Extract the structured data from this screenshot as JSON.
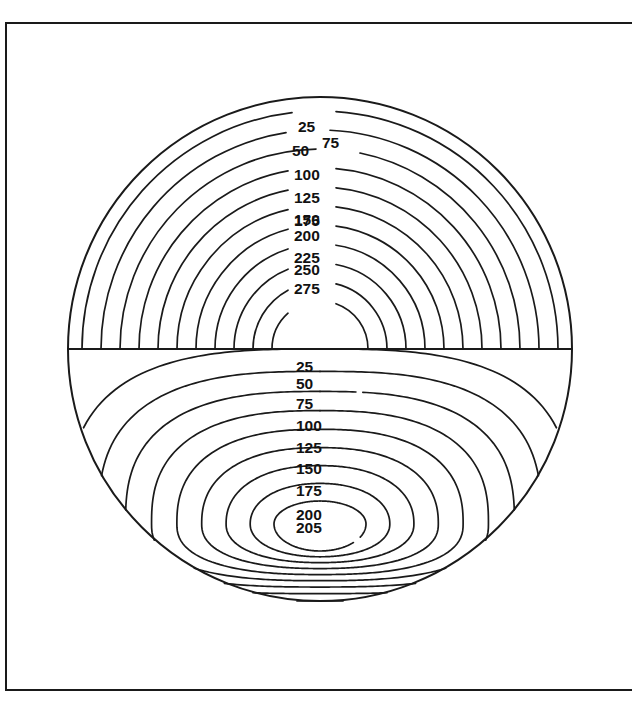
{
  "figure": {
    "caption": "",
    "frame": {
      "stroke_color": "#1a1a1a",
      "left": 5,
      "top": 22,
      "bottom": 689,
      "right_open": true
    },
    "background_color": "#ffffff",
    "line_color": "#1a1a1a"
  },
  "chart_data": {
    "type": "contour",
    "title": "",
    "subtitle": "",
    "xlabel": "",
    "ylabel": "",
    "grid": false,
    "legend": "none",
    "geometry": {
      "circle_center_x": 320,
      "circle_center_y": 349,
      "circle_radius": 252,
      "midline_y": 349
    },
    "panels": [
      {
        "name": "upper-half",
        "contour_style": "concentric-semicircles",
        "origin_x": 320,
        "origin_y": 349,
        "levels": [
          25,
          50,
          75,
          100,
          125,
          150,
          175,
          200,
          225,
          250,
          275
        ],
        "level_radii": [
          238,
          219,
          200,
          181,
          162,
          143,
          124,
          105,
          86,
          67,
          48
        ],
        "labels": [
          "25",
          "50",
          "75",
          "100",
          "125",
          "150",
          "175",
          "200",
          "225",
          "250",
          "275"
        ]
      },
      {
        "name": "lower-half",
        "contour_style": "nested-closed-ovals",
        "center_x": 320,
        "center_y": 524,
        "levels": [
          25,
          50,
          75,
          100,
          125,
          150,
          175,
          200,
          205
        ],
        "labels": [
          "25",
          "50",
          "75",
          "100",
          "125",
          "150",
          "175",
          "200",
          "205"
        ],
        "maximum_value": 205
      }
    ],
    "all_levels": [
      25,
      50,
      75,
      100,
      125,
      150,
      175,
      200,
      225,
      250,
      275,
      205
    ],
    "contour_interval": 25
  },
  "upper_labels": [
    {
      "text": "25",
      "x": 298,
      "y": 128,
      "anchor": "start",
      "gap_half_width": 30
    },
    {
      "text": "50",
      "x": 292,
      "y": 152,
      "anchor": "start",
      "gap_half_width": 30
    },
    {
      "text": "75",
      "x": 322,
      "y": 144,
      "anchor": "start",
      "gap_half_width": 30
    },
    {
      "text": "100",
      "x": 294,
      "y": 176,
      "anchor": "start",
      "gap_half_width": 34
    },
    {
      "text": "125",
      "x": 294,
      "y": 199,
      "anchor": "start",
      "gap_half_width": 34
    },
    {
      "text": "150",
      "x": 294,
      "y": 221,
      "anchor": "start",
      "gap_half_width": 34
    },
    {
      "text": "175",
      "x": 294,
      "y": 222,
      "anchor": "start",
      "gap_half_width": 34
    },
    {
      "text": "200",
      "x": 294,
      "y": 237,
      "anchor": "start",
      "gap_half_width": 34
    },
    {
      "text": "225",
      "x": 294,
      "y": 259,
      "anchor": "start",
      "gap_half_width": 34
    },
    {
      "text": "250",
      "x": 294,
      "y": 271,
      "anchor": "start",
      "gap_half_width": 34
    },
    {
      "text": "275",
      "x": 294,
      "y": 290,
      "anchor": "start",
      "gap_half_width": 34
    }
  ],
  "lower_labels": [
    {
      "text": "25",
      "y": 368
    },
    {
      "text": "50",
      "y": 385
    },
    {
      "text": "75",
      "y": 405
    },
    {
      "text": "100",
      "y": 427
    },
    {
      "text": "125",
      "y": 449
    },
    {
      "text": "150",
      "y": 470
    },
    {
      "text": "175",
      "y": 492
    },
    {
      "text": "200",
      "y": 516
    },
    {
      "text": "205",
      "y": 529
    }
  ]
}
